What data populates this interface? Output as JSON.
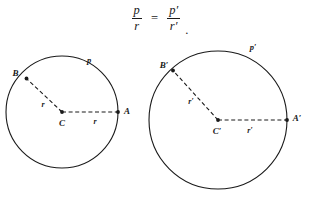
{
  "figure": {
    "caption_formula": {
      "numerator_left": "p",
      "denominator_left": "r",
      "equals": "=",
      "numerator_right": "p′",
      "denominator_right": "r′",
      "terminator": "."
    },
    "background_color": "#ffffff",
    "stroke_color": "#1a1a1a",
    "circles": [
      {
        "id": "left-circle",
        "center_label": "C",
        "arc_label": "p",
        "point_a_label": "A",
        "point_b_label": "B",
        "radius_label_diagonal": "r",
        "radius_label_horizontal": "r",
        "center_x": 62,
        "center_y": 112,
        "radius": 56
      },
      {
        "id": "right-circle",
        "center_label": "C′",
        "arc_label": "p′",
        "point_a_label": "A′",
        "point_b_label": "B′",
        "radius_label_diagonal": "r′",
        "radius_label_horizontal": "r′",
        "center_x": 218,
        "center_y": 120,
        "radius": 69
      }
    ]
  }
}
